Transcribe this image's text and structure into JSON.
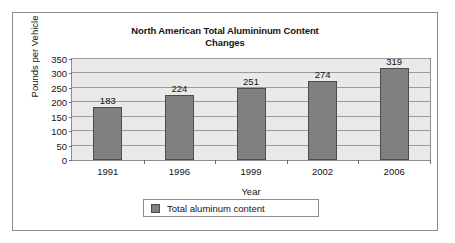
{
  "chart_data": {
    "type": "bar",
    "title": "North American Total Alumininum Content Changes",
    "title_line1": "North American Total Alumininum Content",
    "title_line2": "Changes",
    "xlabel": "Year",
    "ylabel": "Pounds per Vehicle",
    "categories": [
      "1991",
      "1996",
      "1999",
      "2002",
      "2006"
    ],
    "values": [
      183,
      224,
      251,
      274,
      319
    ],
    "value_labels": [
      "183",
      "224",
      "251",
      "274",
      "319"
    ],
    "ylim": [
      0,
      350
    ],
    "ytick_labels": [
      "0",
      "50",
      "100",
      "150",
      "200",
      "250",
      "300",
      "350"
    ],
    "ytick_values": [
      0,
      50,
      100,
      150,
      200,
      250,
      300,
      350
    ],
    "grid": true,
    "legend_position": "bottom",
    "legend": [
      {
        "name": "Total aluminum content",
        "color": "#808080"
      }
    ],
    "series": [
      {
        "name": "Total aluminum content",
        "color": "#808080",
        "values": [
          183,
          224,
          251,
          274,
          319
        ]
      }
    ],
    "colors": {
      "bar_fill": "#808080",
      "bar_border": "#4d4d4d",
      "plot_background": "#e9e9e9",
      "gridline": "#9a9a9a",
      "frame_border": "#8c8c8c",
      "text": "#141414"
    }
  }
}
